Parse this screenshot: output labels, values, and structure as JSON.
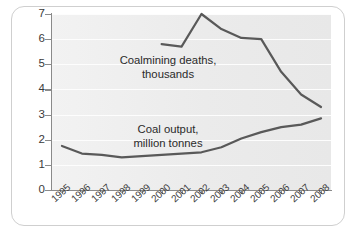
{
  "chart_data": {
    "type": "line",
    "title": "",
    "xlabel": "",
    "ylabel": "",
    "categories": [
      "1995",
      "1996",
      "1997",
      "1998",
      "1999",
      "2000",
      "2001",
      "2002",
      "2003",
      "2004",
      "2005",
      "2006",
      "2007",
      "2008"
    ],
    "ylim": [
      0,
      7
    ],
    "yticks": [
      "0",
      "1",
      "2",
      "3",
      "4",
      "5",
      "6",
      "7"
    ],
    "grid": true,
    "legend_position": "inline-annotation",
    "series": [
      {
        "name": "Coalmining deaths, thousands",
        "label_line1": "Coalmining deaths,",
        "label_line2": "thousands",
        "x": [
          "2000",
          "2001",
          "2002",
          "2003",
          "2004",
          "2005",
          "2006",
          "2007",
          "2008"
        ],
        "values": [
          5.8,
          5.7,
          7.0,
          6.4,
          6.05,
          6.0,
          4.7,
          3.8,
          3.3
        ]
      },
      {
        "name": "Coal output, million tonnes",
        "label_line1": "Coal output,",
        "label_line2": "million tonnes",
        "x": [
          "1995",
          "1996",
          "1997",
          "1998",
          "1999",
          "2000",
          "2001",
          "2002",
          "2003",
          "2004",
          "2005",
          "2006",
          "2007",
          "2008"
        ],
        "values": [
          1.75,
          1.45,
          1.4,
          1.3,
          1.35,
          1.4,
          1.45,
          1.5,
          1.7,
          2.05,
          2.3,
          2.5,
          2.6,
          2.85
        ]
      }
    ]
  },
  "axis": {
    "y_tick_0": "0",
    "y_tick_1": "1",
    "y_tick_2": "2",
    "y_tick_3": "3",
    "y_tick_4": "4",
    "y_tick_5": "5",
    "y_tick_6": "6",
    "y_tick_7": "7"
  },
  "colors": {
    "line": "#595959",
    "axis": "#8a8a8a",
    "plot_background": "#ededed",
    "gridline": "#fdfdfd",
    "card_border": "#cfcfcf",
    "text": "#2b2b2b"
  }
}
